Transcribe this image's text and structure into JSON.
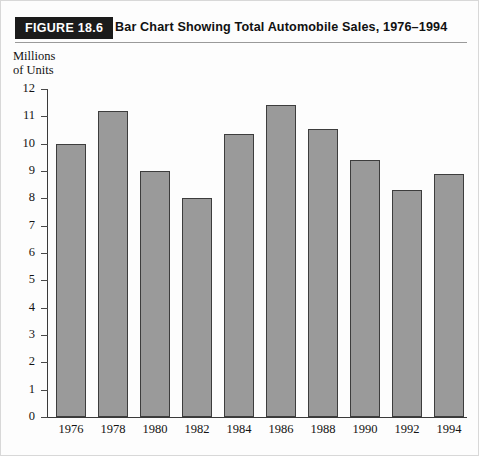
{
  "figure": {
    "tag": "FIGURE 18.6",
    "title": "Bar Chart Showing Total Automobile Sales, 1976–1994"
  },
  "axis_title": {
    "line1": "Millions",
    "line2": "of Units"
  },
  "colors": {
    "bar_fill": "#9a9a9a",
    "bar_stroke": "#3d3d3d",
    "tag_background": "#1b1b1b",
    "tag_text": "#ffffff",
    "axis": "#3a3a3a",
    "page_background": "#fdfdfd"
  },
  "chart_data": {
    "type": "bar",
    "title": "Bar Chart Showing Total Automobile Sales, 1976–1994",
    "xlabel": "",
    "ylabel": "Millions of Units",
    "categories": [
      "1976",
      "1978",
      "1980",
      "1982",
      "1984",
      "1986",
      "1988",
      "1990",
      "1992",
      "1994"
    ],
    "values": [
      10.0,
      11.2,
      9.0,
      8.0,
      10.35,
      11.4,
      10.55,
      9.4,
      8.3,
      8.9
    ],
    "ylim": [
      0,
      12
    ],
    "yticks": [
      0,
      1,
      2,
      3,
      4,
      5,
      6,
      7,
      8,
      9,
      10,
      11,
      12
    ],
    "ytick_labels": [
      "0",
      "1",
      "2",
      "3",
      "4",
      "5",
      "6",
      "7",
      "8",
      "9",
      "10",
      "11",
      "12"
    ],
    "grid": false,
    "legend": false
  }
}
